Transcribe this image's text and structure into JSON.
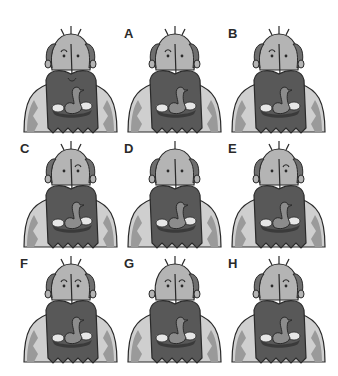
{
  "puzzle": {
    "type": "spot-the-odd-one / find-the-match",
    "subject": "bearded man with bird in nest in beard",
    "colors": {
      "skin": "#b4b4b4",
      "hair": "#6e6e6e",
      "beard": "#585858",
      "coat": "#cfcfcf",
      "coat_pattern": "#9a9a9a",
      "outline": "#2a2a2a",
      "bird": "#8c8c8c",
      "egg": "#e6e6e6",
      "background": "#ffffff"
    },
    "figures": [
      {
        "id": "original",
        "label": "",
        "x": 18,
        "y": 20,
        "mouth_fold": true,
        "hair_side": "both",
        "eye_left": "brow",
        "eye_right": "dot",
        "hairs": 3
      },
      {
        "id": "A",
        "label": "A",
        "x": 122,
        "y": 20,
        "mouth_fold": false,
        "hair_side": "both",
        "eye_left": "brow",
        "eye_right": "dot",
        "hairs": 3
      },
      {
        "id": "B",
        "label": "B",
        "x": 226,
        "y": 20,
        "mouth_fold": false,
        "hair_side": "both",
        "eye_left": "brow",
        "eye_right": "dot",
        "hairs": 3
      },
      {
        "id": "C",
        "label": "C",
        "x": 18,
        "y": 135,
        "mouth_fold": false,
        "hair_side": "both",
        "eye_left": "dot",
        "eye_right": "brow",
        "hairs": 3
      },
      {
        "id": "D",
        "label": "D",
        "x": 122,
        "y": 135,
        "mouth_fold": false,
        "hair_side": "both",
        "eye_left": "dot",
        "eye_right": "dot",
        "hairs": 1
      },
      {
        "id": "E",
        "label": "E",
        "x": 226,
        "y": 135,
        "mouth_fold": false,
        "hair_side": "both",
        "eye_left": "dot",
        "eye_right": "brow",
        "hairs": 3
      },
      {
        "id": "F",
        "label": "F",
        "x": 18,
        "y": 250,
        "mouth_fold": false,
        "hair_side": "both",
        "eye_left": "brow",
        "eye_right": "brow",
        "hairs": 3
      },
      {
        "id": "G",
        "label": "G",
        "x": 122,
        "y": 250,
        "mouth_fold": false,
        "hair_side": "right",
        "eye_left": "brow",
        "eye_right": "brow",
        "hairs": 3
      },
      {
        "id": "H",
        "label": "H",
        "x": 226,
        "y": 250,
        "mouth_fold": false,
        "hair_side": "both",
        "eye_left": "dot",
        "eye_right": "brow",
        "hairs": 3
      }
    ]
  }
}
